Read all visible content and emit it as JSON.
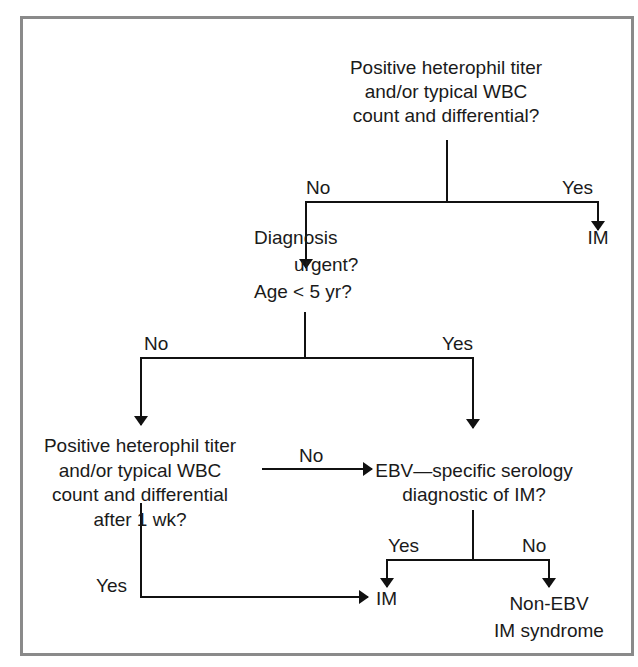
{
  "diagram": {
    "type": "flowchart",
    "topic": "Diagnostic algorithm for infectious mononucleosis (IM)",
    "nodes": {
      "q1": {
        "lines": [
          "Positive heterophil titer",
          "and/or typical WBC",
          "count and differential?"
        ]
      },
      "im_top": {
        "label": "IM"
      },
      "q2": {
        "lines": [
          "Diagnosis",
          "urgent?",
          "Age < 5 yr?"
        ]
      },
      "q3": {
        "lines": [
          "Positive heterophil titer",
          "and/or typical WBC",
          "count and differential",
          "after 1 wk?"
        ]
      },
      "q4": {
        "lines": [
          "EBV—specific serology",
          "diagnostic of IM?"
        ]
      },
      "im_bottom": {
        "label": "IM"
      },
      "non_ebv": {
        "lines": [
          "Non-EBV",
          "IM syndrome"
        ]
      }
    },
    "edges": {
      "q1_no": "No",
      "q1_yes": "Yes",
      "q2_no": "No",
      "q2_yes": "Yes",
      "q3_no": "No",
      "q3_yes": "Yes",
      "q4_yes": "Yes",
      "q4_no": "No"
    },
    "colors": {
      "line": "#111111",
      "frame": "#8a8a8a",
      "background": "#ffffff"
    }
  }
}
